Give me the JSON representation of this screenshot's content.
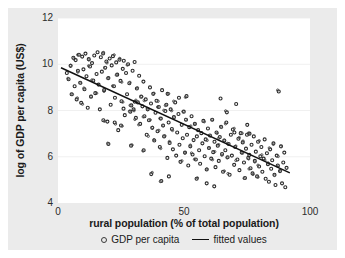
{
  "figure": {
    "background": "#ebebeb",
    "plot_background": "#ffffff"
  },
  "chart_data": {
    "type": "scatter",
    "title": "",
    "xlabel": "rural population (% of total population)",
    "ylabel": "log of GDP per capita (US$)",
    "xlim": [
      0,
      100
    ],
    "ylim": [
      4,
      12
    ],
    "xticks": [
      "0",
      "50",
      "100"
    ],
    "xtick_values": [
      0,
      50,
      100
    ],
    "yticks": [
      "4",
      "6",
      "8",
      "10",
      "12"
    ],
    "ytick_values": [
      4,
      6,
      8,
      10,
      12
    ],
    "grid": "horizontal",
    "grid_color": "#f0f0f0",
    "legend_position": "below",
    "marker_color": "#2a2a2a",
    "line_color": "#111111",
    "legend": [
      {
        "label": "GDP per capita",
        "marker": "circle-open"
      },
      {
        "label": "fitted values",
        "marker": "line"
      }
    ],
    "series": [
      {
        "name": "GDP per capita",
        "points": [
          [
            3.5,
            9.62
          ],
          [
            4.2,
            9.35
          ],
          [
            5.0,
            9.93
          ],
          [
            5.4,
            8.7
          ],
          [
            6.1,
            10.28
          ],
          [
            6.6,
            9.05
          ],
          [
            7.0,
            10.18
          ],
          [
            7.4,
            8.48
          ],
          [
            7.9,
            9.72
          ],
          [
            8.3,
            10.41
          ],
          [
            8.8,
            9.2
          ],
          [
            9.2,
            8.33
          ],
          [
            9.6,
            10.33
          ],
          [
            10.1,
            9.78
          ],
          [
            10.5,
            8.92
          ],
          [
            10.9,
            10.46
          ],
          [
            11.3,
            9.48
          ],
          [
            11.8,
            8.12
          ],
          [
            12.2,
            10.22
          ],
          [
            12.7,
            9.9
          ],
          [
            13.1,
            8.6
          ],
          [
            13.5,
            10.05
          ],
          [
            14.0,
            9.3
          ],
          [
            14.4,
            10.38
          ],
          [
            14.8,
            8.75
          ],
          [
            15.3,
            9.58
          ],
          [
            15.7,
            10.52
          ],
          [
            16.1,
            9.12
          ],
          [
            16.6,
            8.05
          ],
          [
            17.0,
            10.3
          ],
          [
            17.4,
            9.68
          ],
          [
            17.9,
            10.47
          ],
          [
            18.3,
            8.88
          ],
          [
            18.7,
            9.85
          ],
          [
            19.2,
            10.12
          ],
          [
            19.6,
            7.52
          ],
          [
            20.0,
            9.4
          ],
          [
            20.5,
            10.25
          ],
          [
            20.9,
            8.25
          ],
          [
            21.3,
            9.95
          ],
          [
            21.8,
            10.35
          ],
          [
            22.2,
            9.05
          ],
          [
            22.6,
            8.55
          ],
          [
            23.1,
            10.08
          ],
          [
            23.5,
            9.55
          ],
          [
            23.9,
            7.15
          ],
          [
            24.4,
            10.2
          ],
          [
            24.8,
            9.28
          ],
          [
            25.2,
            8.4
          ],
          [
            25.7,
            9.8
          ],
          [
            26.1,
            10.15
          ],
          [
            26.5,
            7.8
          ],
          [
            27.0,
            9.62
          ],
          [
            27.4,
            8.7
          ],
          [
            27.8,
            10.0
          ],
          [
            28.3,
            9.18
          ],
          [
            28.7,
            7.95
          ],
          [
            29.1,
            8.22
          ],
          [
            29.6,
            9.72
          ],
          [
            30.0,
            8.05
          ],
          [
            30.4,
            10.1
          ],
          [
            30.9,
            7.68
          ],
          [
            31.3,
            8.95
          ],
          [
            31.7,
            8.35
          ],
          [
            32.2,
            9.5
          ],
          [
            32.6,
            7.42
          ],
          [
            33.0,
            8.6
          ],
          [
            33.5,
            8.18
          ],
          [
            33.9,
            9.25
          ],
          [
            34.3,
            7.75
          ],
          [
            34.8,
            8.48
          ],
          [
            35.2,
            6.95
          ],
          [
            35.6,
            8.05
          ],
          [
            36.1,
            7.58
          ],
          [
            36.5,
            9.0
          ],
          [
            36.9,
            8.3
          ],
          [
            37.4,
            7.25
          ],
          [
            37.8,
            8.72
          ],
          [
            38.2,
            6.7
          ],
          [
            38.7,
            7.9
          ],
          [
            39.1,
            8.42
          ],
          [
            39.5,
            7.1
          ],
          [
            40.0,
            8.15
          ],
          [
            40.4,
            6.42
          ],
          [
            40.8,
            7.65
          ],
          [
            41.3,
            8.88
          ],
          [
            41.7,
            7.35
          ],
          [
            42.1,
            6.88
          ],
          [
            42.6,
            7.98
          ],
          [
            43.0,
            8.25
          ],
          [
            43.4,
            5.95
          ],
          [
            43.9,
            7.48
          ],
          [
            44.3,
            6.6
          ],
          [
            44.7,
            8.05
          ],
          [
            45.2,
            7.2
          ],
          [
            45.6,
            6.32
          ],
          [
            46.0,
            7.72
          ],
          [
            46.5,
            8.35
          ],
          [
            46.9,
            6.05
          ],
          [
            47.3,
            7.05
          ],
          [
            47.8,
            7.85
          ],
          [
            48.2,
            6.52
          ],
          [
            48.6,
            5.78
          ],
          [
            49.1,
            7.38
          ],
          [
            49.5,
            6.8
          ],
          [
            49.9,
            7.95
          ],
          [
            50.4,
            6.18
          ],
          [
            50.8,
            7.6
          ],
          [
            51.2,
            6.95
          ],
          [
            51.7,
            5.62
          ],
          [
            52.1,
            7.28
          ],
          [
            52.5,
            6.45
          ],
          [
            53.0,
            7.75
          ],
          [
            53.4,
            6.1
          ],
          [
            53.8,
            6.72
          ],
          [
            54.3,
            7.42
          ],
          [
            54.7,
            5.88
          ],
          [
            55.1,
            6.88
          ],
          [
            55.6,
            7.15
          ],
          [
            56.0,
            6.28
          ],
          [
            56.4,
            5.7
          ],
          [
            56.9,
            7.02
          ],
          [
            57.3,
            6.58
          ],
          [
            57.7,
            7.55
          ],
          [
            58.2,
            6.02
          ],
          [
            58.6,
            6.75
          ],
          [
            59.0,
            5.45
          ],
          [
            59.5,
            7.22
          ],
          [
            59.9,
            6.38
          ],
          [
            60.3,
            6.92
          ],
          [
            60.8,
            5.92
          ],
          [
            61.2,
            7.6
          ],
          [
            61.6,
            6.2
          ],
          [
            62.1,
            6.65
          ],
          [
            62.5,
            5.55
          ],
          [
            62.9,
            7.05
          ],
          [
            63.4,
            6.48
          ],
          [
            63.8,
            5.82
          ],
          [
            64.2,
            6.85
          ],
          [
            64.7,
            7.3
          ],
          [
            65.1,
            6.12
          ],
          [
            65.5,
            5.35
          ],
          [
            66.0,
            6.7
          ],
          [
            66.4,
            6.28
          ],
          [
            66.8,
            7.48
          ],
          [
            67.3,
            5.98
          ],
          [
            67.7,
            6.55
          ],
          [
            68.1,
            5.22
          ],
          [
            68.6,
            6.95
          ],
          [
            69.0,
            6.05
          ],
          [
            69.4,
            7.18
          ],
          [
            69.9,
            5.65
          ],
          [
            70.3,
            6.42
          ],
          [
            70.7,
            8.28
          ],
          [
            71.2,
            5.88
          ],
          [
            71.6,
            6.78
          ],
          [
            72.0,
            5.42
          ],
          [
            72.5,
            7.02
          ],
          [
            72.9,
            6.18
          ],
          [
            73.3,
            6.62
          ],
          [
            73.8,
            5.75
          ],
          [
            74.2,
            5.08
          ],
          [
            74.6,
            6.35
          ],
          [
            75.1,
            7.38
          ],
          [
            75.5,
            5.95
          ],
          [
            75.9,
            6.08
          ],
          [
            76.4,
            5.5
          ],
          [
            76.8,
            6.52
          ],
          [
            77.2,
            5.28
          ],
          [
            77.7,
            6.88
          ],
          [
            78.1,
            5.82
          ],
          [
            78.5,
            6.22
          ],
          [
            79.0,
            5.15
          ],
          [
            79.4,
            6.65
          ],
          [
            79.8,
            5.58
          ],
          [
            80.3,
            6.02
          ],
          [
            80.7,
            6.42
          ],
          [
            81.1,
            5.35
          ],
          [
            81.6,
            5.92
          ],
          [
            82.0,
            6.75
          ],
          [
            82.4,
            5.05
          ],
          [
            82.9,
            6.15
          ],
          [
            83.3,
            5.68
          ],
          [
            83.7,
            4.92
          ],
          [
            84.2,
            6.32
          ],
          [
            84.6,
            5.48
          ],
          [
            85.0,
            5.85
          ],
          [
            85.5,
            6.58
          ],
          [
            85.9,
            5.22
          ],
          [
            86.3,
            4.78
          ],
          [
            86.8,
            6.05
          ],
          [
            87.2,
            5.62
          ],
          [
            87.6,
            8.82
          ],
          [
            88.1,
            5.38
          ],
          [
            88.5,
            6.45
          ],
          [
            88.9,
            4.85
          ],
          [
            89.4,
            5.75
          ],
          [
            89.8,
            6.18
          ],
          [
            90.2,
            4.68
          ],
          [
            90.7,
            5.52
          ],
          [
            64.5,
            8.52
          ],
          [
            67.0,
            7.92
          ],
          [
            70.0,
            7.05
          ],
          [
            75.0,
            6.95
          ],
          [
            76.0,
            7.0
          ],
          [
            37.0,
            5.25
          ],
          [
            41.0,
            4.95
          ],
          [
            44.0,
            5.15
          ],
          [
            59.0,
            4.85
          ],
          [
            62.0,
            4.72
          ],
          [
            55.0,
            5.05
          ],
          [
            29.0,
            6.48
          ],
          [
            20.0,
            6.55
          ],
          [
            25.0,
            7.35
          ],
          [
            18.0,
            7.58
          ],
          [
            22.5,
            7.48
          ],
          [
            34.0,
            6.28
          ],
          [
            48.0,
            8.55
          ],
          [
            51.0,
            8.62
          ],
          [
            43.5,
            8.72
          ],
          [
            30.5,
            8.38
          ],
          [
            26.0,
            8.08
          ]
        ]
      }
    ],
    "fit_line": {
      "name": "fitted values",
      "x": [
        1.2,
        92.0
      ],
      "y": [
        9.85,
        5.3
      ]
    }
  }
}
